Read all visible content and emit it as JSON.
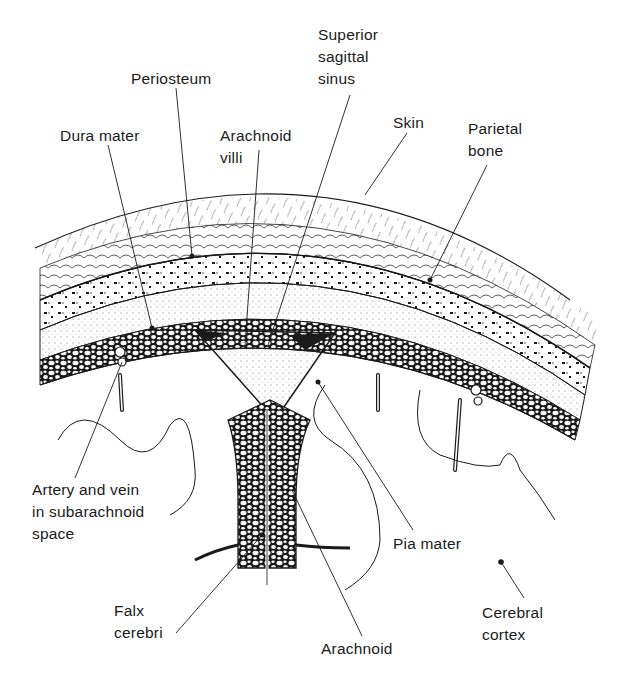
{
  "diagram": {
    "colors": {
      "ink": "#1a1a1a",
      "background": "#ffffff"
    },
    "labels": [
      {
        "id": "superior-sagittal-sinus",
        "text": "Superior\nsagittal\nsinus",
        "x": 318,
        "y": 24
      },
      {
        "id": "periosteum",
        "text": "Periosteum",
        "x": 131,
        "y": 68
      },
      {
        "id": "skin",
        "text": "Skin",
        "x": 393,
        "y": 112
      },
      {
        "id": "parietal-bone",
        "text": "Parietal\nbone",
        "x": 468,
        "y": 118
      },
      {
        "id": "dura-mater",
        "text": "Dura mater",
        "x": 60,
        "y": 125
      },
      {
        "id": "arachnoid-villi",
        "text": "Arachnoid\nvilli",
        "x": 220,
        "y": 125
      },
      {
        "id": "artery-vein",
        "text": "Artery and vein\nin subarachnoid\nspace",
        "x": 32,
        "y": 479
      },
      {
        "id": "pia-mater",
        "text": "Pia mater",
        "x": 393,
        "y": 533
      },
      {
        "id": "falx-cerebri",
        "text": "Falx\ncerebri",
        "x": 114,
        "y": 600
      },
      {
        "id": "cerebral-cortex",
        "text": "Cerebral\ncortex",
        "x": 482,
        "y": 602
      },
      {
        "id": "arachnoid",
        "text": "Arachnoid",
        "x": 321,
        "y": 638
      }
    ]
  }
}
